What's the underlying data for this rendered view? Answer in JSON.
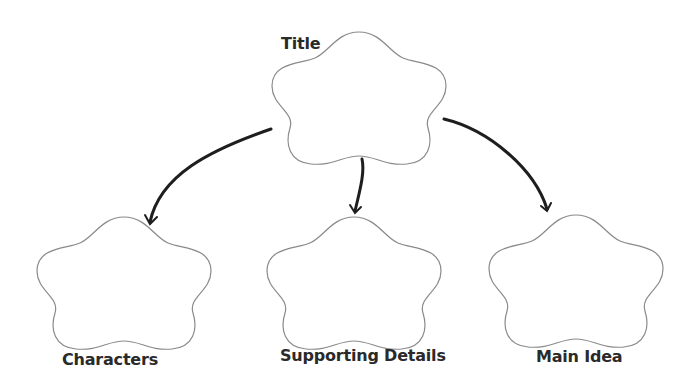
{
  "diagram": {
    "type": "graphic-organizer",
    "nodes": [
      {
        "id": "title",
        "label": "Title"
      },
      {
        "id": "characters",
        "label": "Characters"
      },
      {
        "id": "supporting",
        "label": "Supporting Details"
      },
      {
        "id": "main",
        "label": "Main Idea"
      }
    ],
    "edges": [
      {
        "from": "title",
        "to": "characters"
      },
      {
        "from": "title",
        "to": "supporting"
      },
      {
        "from": "title",
        "to": "main"
      }
    ],
    "colors": {
      "outline": "#8a8a8a",
      "arrow": "#1e1e1e",
      "text": "#2a2a2a"
    }
  }
}
